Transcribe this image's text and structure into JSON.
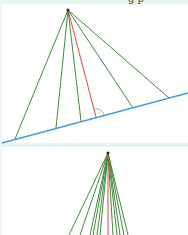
{
  "header": {
    "cut_text": "g p"
  },
  "colors": {
    "line_green": "#3f8a3a",
    "line_red": "#e0453a",
    "baseline_blue": "#3aa0dc",
    "apex_dark": "#2b2b3a",
    "band": "#e6f3ef"
  },
  "figure_top": {
    "description": "Lines from a point to a slanted line; perpendicular shown in red with right-angle mark",
    "apex": [
      68,
      10
    ],
    "baseline": [
      [
        2,
        143
      ],
      [
        188,
        93
      ]
    ],
    "green_feet": [
      [
        15,
        139
      ],
      [
        56,
        128
      ],
      [
        81,
        121
      ],
      [
        133,
        108
      ],
      [
        169,
        98
      ]
    ],
    "red_foot": [
      96,
      117
    ]
  },
  "figure_bottom": {
    "description": "Many lines from a point; perpendicular shown in red",
    "apex": [
      108,
      153
    ],
    "green_ends_x": [
      69,
      80,
      90,
      93,
      97,
      100,
      113,
      117,
      120,
      124,
      128
    ],
    "red_end_x": 108,
    "end_y": 235
  }
}
